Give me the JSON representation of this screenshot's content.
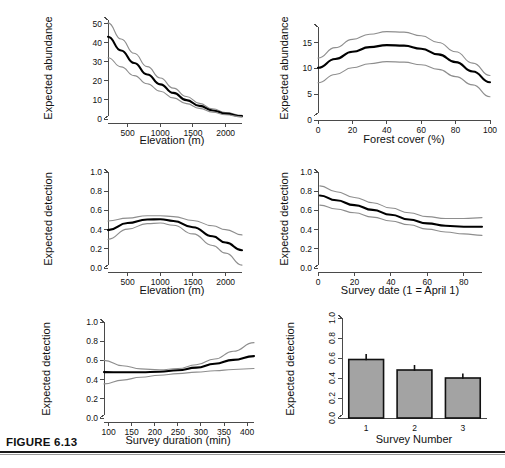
{
  "figure": {
    "caption_label": "FIGURE 6.13"
  },
  "chart_data": [
    {
      "id": "abundance-elevation",
      "type": "line",
      "title": "",
      "xlabel": "Elevation (m)",
      "ylabel": "Expected abundance",
      "xlim": [
        200,
        2250
      ],
      "ylim": [
        0,
        52
      ],
      "xticks": [
        500,
        1000,
        1500,
        2000
      ],
      "yticks": [
        0,
        10,
        20,
        30,
        40,
        50
      ],
      "grid": false,
      "series": [
        {
          "name": "upper CI",
          "style": "ci",
          "x": [
            200,
            400,
            600,
            800,
            1000,
            1200,
            1400,
            1600,
            1800,
            2000,
            2250
          ],
          "values": [
            50.5,
            42.0,
            34.5,
            27.5,
            21.5,
            16.2,
            11.8,
            8.2,
            5.4,
            3.4,
            1.9
          ]
        },
        {
          "name": "expected abundance",
          "style": "main",
          "x": [
            200,
            400,
            600,
            800,
            1000,
            1200,
            1400,
            1600,
            1800,
            2000,
            2250
          ],
          "values": [
            43.2,
            36.0,
            29.4,
            23.4,
            18.2,
            13.7,
            9.9,
            6.9,
            4.5,
            2.8,
            1.5
          ]
        },
        {
          "name": "lower CI",
          "style": "ci",
          "x": [
            200,
            400,
            600,
            800,
            1000,
            1200,
            1400,
            1600,
            1800,
            2000,
            2250
          ],
          "values": [
            32.2,
            27.4,
            22.8,
            18.5,
            14.6,
            11.1,
            8.1,
            5.6,
            3.6,
            2.2,
            1.1
          ]
        }
      ]
    },
    {
      "id": "abundance-forest-cover",
      "type": "line",
      "title": "",
      "xlabel": "Forest cover (%)",
      "ylabel": "Expected abundance",
      "xlim": [
        0,
        100
      ],
      "ylim": [
        0,
        18
      ],
      "xticks": [
        0,
        20,
        40,
        60,
        80,
        100
      ],
      "yticks": [
        0,
        5,
        10,
        15
      ],
      "grid": false,
      "series": [
        {
          "name": "upper CI",
          "style": "ci",
          "x": [
            0,
            10,
            20,
            30,
            40,
            50,
            60,
            70,
            80,
            90,
            100
          ],
          "values": [
            12.0,
            14.0,
            15.6,
            16.6,
            17.1,
            17.0,
            16.3,
            15.0,
            13.2,
            11.0,
            8.6
          ]
        },
        {
          "name": "expected abundance",
          "style": "main",
          "x": [
            0,
            10,
            20,
            30,
            40,
            50,
            60,
            70,
            80,
            90,
            100
          ],
          "values": [
            10.1,
            11.8,
            13.2,
            14.1,
            14.5,
            14.4,
            13.8,
            12.7,
            11.2,
            9.4,
            7.3
          ]
        },
        {
          "name": "lower CI",
          "style": "ci",
          "x": [
            0,
            10,
            20,
            30,
            40,
            50,
            60,
            70,
            80,
            90,
            100
          ],
          "values": [
            7.2,
            8.8,
            10.1,
            10.9,
            11.3,
            11.2,
            10.7,
            9.8,
            8.4,
            6.8,
            4.5
          ]
        }
      ]
    },
    {
      "id": "detection-elevation",
      "type": "line",
      "title": "",
      "xlabel": "Elevation (m)",
      "ylabel": "Expected detection",
      "xlim": [
        200,
        2250
      ],
      "ylim": [
        0.0,
        1.0
      ],
      "xticks": [
        500,
        1000,
        1500,
        2000
      ],
      "yticks": [
        0.0,
        0.2,
        0.4,
        0.6,
        0.8,
        1.0
      ],
      "grid": false,
      "series": [
        {
          "name": "upper CI",
          "style": "ci",
          "x": [
            200,
            500,
            800,
            1000,
            1200,
            1500,
            1800,
            2000,
            2250
          ],
          "values": [
            0.49,
            0.52,
            0.545,
            0.545,
            0.535,
            0.495,
            0.44,
            0.4,
            0.345
          ]
        },
        {
          "name": "expected detection",
          "style": "main",
          "x": [
            200,
            500,
            800,
            1000,
            1200,
            1500,
            1800,
            2000,
            2250
          ],
          "values": [
            0.395,
            0.468,
            0.505,
            0.508,
            0.49,
            0.425,
            0.33,
            0.265,
            0.185
          ]
        },
        {
          "name": "lower CI",
          "style": "ci",
          "x": [
            200,
            500,
            800,
            1000,
            1200,
            1500,
            1800,
            2000,
            2250
          ],
          "values": [
            0.3,
            0.405,
            0.462,
            0.468,
            0.445,
            0.355,
            0.235,
            0.155,
            0.03
          ]
        }
      ]
    },
    {
      "id": "detection-survey-date",
      "type": "line",
      "title": "",
      "xlabel": "Survey date (1 = April 1)",
      "ylabel": "Expected detection",
      "xlim": [
        0,
        90
      ],
      "ylim": [
        0.0,
        1.0
      ],
      "xticks": [
        0,
        20,
        40,
        60,
        80
      ],
      "yticks": [
        0.0,
        0.2,
        0.4,
        0.6,
        0.8,
        1.0
      ],
      "grid": false,
      "series": [
        {
          "name": "upper CI",
          "style": "ci",
          "x": [
            1,
            10,
            20,
            30,
            40,
            50,
            60,
            70,
            80,
            90
          ],
          "values": [
            0.855,
            0.795,
            0.735,
            0.68,
            0.625,
            0.575,
            0.535,
            0.515,
            0.515,
            0.525
          ]
        },
        {
          "name": "expected detection",
          "style": "main",
          "x": [
            1,
            10,
            20,
            30,
            40,
            50,
            60,
            70,
            80,
            90
          ],
          "values": [
            0.755,
            0.705,
            0.655,
            0.605,
            0.555,
            0.505,
            0.465,
            0.44,
            0.43,
            0.43
          ]
        },
        {
          "name": "lower CI",
          "style": "ci",
          "x": [
            1,
            10,
            20,
            30,
            40,
            50,
            60,
            70,
            80,
            90
          ],
          "values": [
            0.655,
            0.615,
            0.575,
            0.53,
            0.49,
            0.45,
            0.405,
            0.375,
            0.355,
            0.34
          ]
        }
      ]
    },
    {
      "id": "detection-survey-duration",
      "type": "line",
      "title": "",
      "xlabel": "Survey duration (min)",
      "ylabel": "Expected detection",
      "xlim": [
        90,
        415
      ],
      "ylim": [
        0.0,
        1.0
      ],
      "xticks": [
        100,
        150,
        200,
        250,
        300,
        350,
        400
      ],
      "yticks": [
        0.0,
        0.2,
        0.4,
        0.6,
        0.8,
        1.0
      ],
      "grid": false,
      "series": [
        {
          "name": "upper CI",
          "style": "ci",
          "x": [
            90,
            130,
            170,
            210,
            250,
            290,
            330,
            370,
            415
          ],
          "values": [
            0.6,
            0.545,
            0.512,
            0.502,
            0.515,
            0.555,
            0.615,
            0.695,
            0.785
          ]
        },
        {
          "name": "expected detection",
          "style": "main",
          "x": [
            90,
            130,
            170,
            210,
            250,
            290,
            330,
            370,
            415
          ],
          "values": [
            0.478,
            0.476,
            0.477,
            0.482,
            0.497,
            0.525,
            0.565,
            0.605,
            0.645
          ]
        },
        {
          "name": "lower CI",
          "style": "ci",
          "x": [
            90,
            130,
            170,
            210,
            250,
            290,
            330,
            370,
            415
          ],
          "values": [
            0.355,
            0.395,
            0.425,
            0.445,
            0.462,
            0.478,
            0.492,
            0.505,
            0.515
          ]
        }
      ]
    },
    {
      "id": "detection-survey-number",
      "type": "bar",
      "title": "",
      "xlabel": "Survey Number",
      "ylabel": "Expected detection",
      "categories": [
        "1",
        "2",
        "3"
      ],
      "values": [
        0.585,
        0.48,
        0.4
      ],
      "errors": [
        0.055,
        0.05,
        0.045
      ],
      "ylim": [
        0.0,
        1.0
      ],
      "yticks": [
        0.0,
        0.2,
        0.4,
        0.6,
        0.8,
        1.0
      ],
      "grid": false,
      "bar_color": "#a3a3a3",
      "bar_edge_color": "#111111"
    }
  ]
}
